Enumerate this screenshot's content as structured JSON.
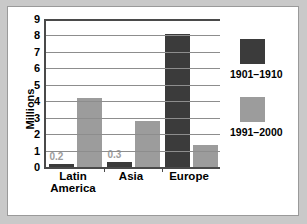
{
  "chart_data": {
    "type": "bar",
    "title": "",
    "xlabel": "",
    "ylabel": "Millions",
    "ylim": [
      0,
      9
    ],
    "ytick_step": 1,
    "grid": true,
    "legend_position": "right",
    "categories": [
      "Latin America",
      "Asia",
      "Europe"
    ],
    "series": [
      {
        "name": "1901–1910",
        "color": "#3b3b3b",
        "values": [
          0.2,
          0.3,
          8.1
        ],
        "labels": [
          "0.2",
          "0.3",
          ""
        ]
      },
      {
        "name": "1991–2000",
        "color": "#9c9c9c",
        "values": [
          4.2,
          2.8,
          1.35
        ],
        "labels": [
          "",
          "",
          ""
        ]
      }
    ],
    "yticks": [
      "9",
      "8",
      "7",
      "6",
      "5",
      "4",
      "3",
      "2",
      "1",
      "0"
    ]
  },
  "axis": {
    "y_title": "Millions"
  },
  "legend": {
    "entries": [
      {
        "label": "1901–1910",
        "swatch": "dark"
      },
      {
        "label": "1991–2000",
        "swatch": "light"
      }
    ]
  },
  "categories": [
    {
      "label": "Latin\nAmerica"
    },
    {
      "label": "Asia"
    },
    {
      "label": "Europe"
    }
  ],
  "colors": {
    "series_old": "#3b3b3b",
    "series_new": "#9c9c9c",
    "grid": "#8d8d8d",
    "axis": "#4a4a4a",
    "page_background": "#c9c9c9",
    "panel_background": "#ffffff",
    "value_label": "#9c9c9c"
  }
}
